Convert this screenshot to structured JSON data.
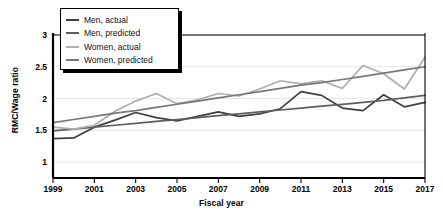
{
  "chart_data": {
    "type": "line",
    "title": "",
    "xlabel": "Fiscal year",
    "ylabel": "RMC/Wage ratio",
    "xlim": [
      1999,
      2017
    ],
    "ylim": [
      0.75,
      3.0
    ],
    "yticks": [
      "1",
      "1.5",
      "2",
      "2.5",
      "3"
    ],
    "ytick_values": [
      1,
      1.5,
      2,
      2.5,
      3
    ],
    "xticks": [
      "1999",
      "2001",
      "2003",
      "2005",
      "2007",
      "2009",
      "2011",
      "2013",
      "2015",
      "2017"
    ],
    "xtick_values": [
      1999,
      2001,
      2003,
      2005,
      2007,
      2009,
      2011,
      2013,
      2015,
      2017
    ],
    "grid": "horizontal",
    "legend_position": "top-left",
    "x": [
      1999,
      2000,
      2001,
      2002,
      2003,
      2004,
      2005,
      2006,
      2007,
      2008,
      2009,
      2010,
      2011,
      2012,
      2013,
      2014,
      2015,
      2016,
      2017
    ],
    "series": [
      {
        "name": "Men, actual",
        "color": "#3f3f3f",
        "width": 1.7,
        "values": [
          1.37,
          1.38,
          1.55,
          1.66,
          1.78,
          1.7,
          1.65,
          1.72,
          1.79,
          1.72,
          1.76,
          1.84,
          2.11,
          2.05,
          1.85,
          1.81,
          2.06,
          1.87,
          1.94
        ]
      },
      {
        "name": "Men, predicted",
        "color": "#5e5e5e",
        "width": 1.7,
        "values": [
          1.49,
          1.52,
          1.55,
          1.58,
          1.61,
          1.64,
          1.67,
          1.7,
          1.73,
          1.76,
          1.79,
          1.82,
          1.85,
          1.88,
          1.91,
          1.94,
          1.97,
          2.01,
          2.05
        ]
      },
      {
        "name": "Women, actual",
        "color": "#aeaeae",
        "width": 1.7,
        "values": [
          1.55,
          1.52,
          1.58,
          1.8,
          1.96,
          2.08,
          1.92,
          1.98,
          2.08,
          2.04,
          2.15,
          2.28,
          2.23,
          2.28,
          2.16,
          2.52,
          2.39,
          2.15,
          2.65
        ]
      },
      {
        "name": "Women, predicted",
        "color": "#787878",
        "width": 1.7,
        "values": [
          1.62,
          1.67,
          1.72,
          1.77,
          1.81,
          1.86,
          1.91,
          1.96,
          2.01,
          2.06,
          2.11,
          2.16,
          2.21,
          2.25,
          2.3,
          2.35,
          2.4,
          2.45,
          2.5
        ]
      }
    ]
  },
  "axis": {
    "spine_color": "#000000",
    "grid_color": "#e2e2e2"
  }
}
